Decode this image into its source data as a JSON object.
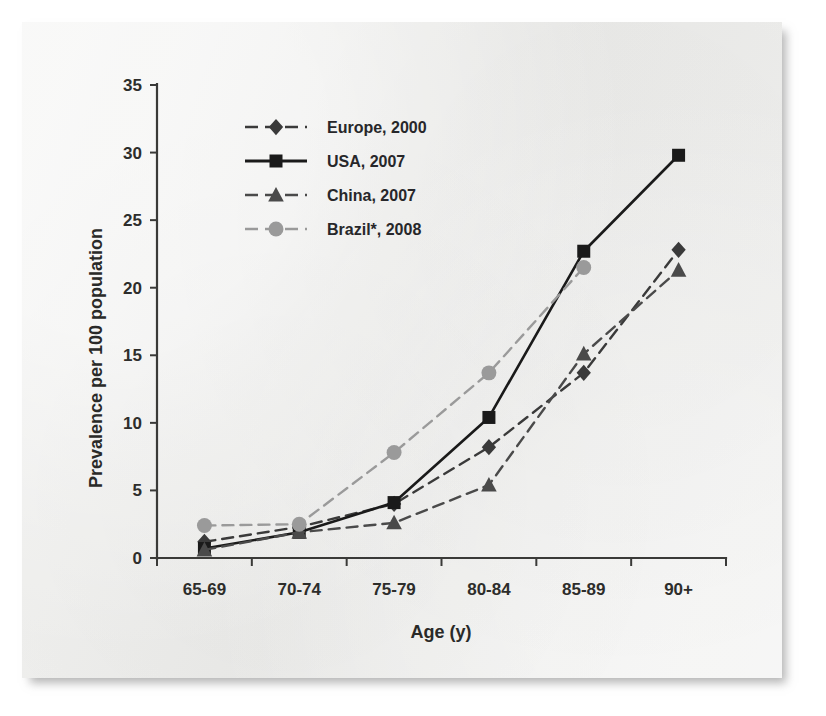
{
  "figure": {
    "background_color": "#efefed",
    "page_color": "#ffffff"
  },
  "chart_data": {
    "type": "line",
    "title": "",
    "subtitle": "",
    "xlabel": "Age (y)",
    "ylabel": "Prevalence per 100 population",
    "categories": [
      "65-69",
      "70-74",
      "75-79",
      "80-84",
      "85-89",
      "90+"
    ],
    "ylim": [
      0,
      35
    ],
    "yticks": [
      0,
      5,
      10,
      15,
      20,
      25,
      30,
      35
    ],
    "ytick_labels": [
      "0",
      "5",
      "10",
      "15",
      "20",
      "25",
      "30",
      "35"
    ],
    "grid": false,
    "legend_position": "upper-left-inside",
    "annotations": [],
    "series": [
      {
        "name": "Europe, 2000",
        "values": [
          1.2,
          2.3,
          4.0,
          8.2,
          13.7,
          22.8
        ],
        "color": "#3a3a3a",
        "marker": "diamond",
        "linestyle": "dashed"
      },
      {
        "name": "USA, 2007",
        "values": [
          0.7,
          1.9,
          4.1,
          10.4,
          22.7,
          29.8
        ],
        "color": "#1a1a1a",
        "marker": "square",
        "linestyle": "solid"
      },
      {
        "name": "China, 2007",
        "values": [
          0.6,
          1.9,
          2.6,
          5.4,
          15.1,
          21.3
        ],
        "color": "#4a4a4a",
        "marker": "triangle",
        "linestyle": "dashed"
      },
      {
        "name": "Brazil*, 2008",
        "values": [
          2.4,
          2.5,
          7.8,
          13.7,
          21.5,
          null
        ],
        "color": "#9a9a9a",
        "marker": "circle",
        "linestyle": "dashed"
      }
    ]
  }
}
